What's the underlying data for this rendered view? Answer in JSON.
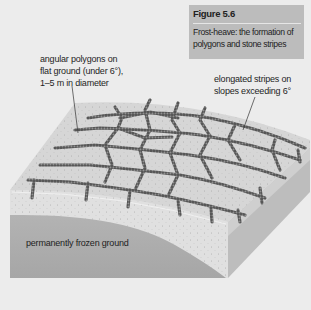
{
  "caption": {
    "figure_number": "Figure 5.6",
    "title_line1": "Frost-heave: the formation of",
    "title_line2": "polygons and stone stripes"
  },
  "labels": {
    "polygons_line1": "angular polygons on",
    "polygons_line2": "flat ground (under 6°),",
    "polygons_line3": "1–5 m in diameter",
    "stripes_line1": "elongated stripes  on",
    "stripes_line2": "slopes exceeding 6°",
    "frozen_ground": "permanently frozen ground"
  },
  "colors": {
    "background": "#ececec",
    "caption_box": "#bcbcbc",
    "surface": "#d9d9d9",
    "active_layer": "#e2e2e2",
    "frozen_layer": "#a9a9a9",
    "side_face": "#b8b8b8",
    "stone_borders": "#5a5a5a"
  }
}
